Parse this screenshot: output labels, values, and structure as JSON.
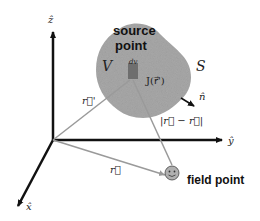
{
  "diagram": {
    "axes": {
      "z_label": "ẑ",
      "y_label": "ŷ",
      "x_label": "x̂"
    },
    "region": {
      "volume_label": "V",
      "surface_label": "S",
      "normal_label": "n̂",
      "source_label_line1": "source",
      "source_label_line2": "point",
      "element_label": "dv",
      "current_label": "J(r⃗')"
    },
    "vectors": {
      "r_prime_label": "r⃗'",
      "r_label": "r⃗",
      "difference_label": "|r⃗ − r⃗|"
    },
    "field_point_label": "field point",
    "colors": {
      "blob_fill": "#a8a8a8",
      "axis": "#111111",
      "vector_gray": "#9a9a9a",
      "element_dark": "#6e6e6e",
      "face_fill": "#b0b0b0"
    }
  }
}
